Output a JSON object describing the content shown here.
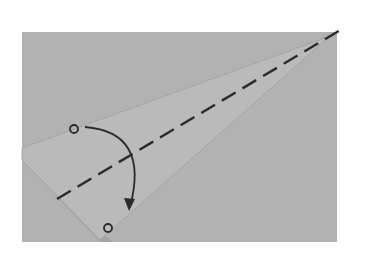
{
  "diagram": {
    "type": "origami-fold-step",
    "colors": {
      "background": "#ffffff",
      "paper": "#b2b2b2",
      "flap": "#bababa",
      "flap_edge": "#9a9a9a",
      "shadow": "#8f8f8f",
      "line": "#2a2a2a"
    },
    "paper": {
      "x": 22,
      "y": 32,
      "width": 315,
      "height": 210
    },
    "flap_polygon": "22,148 330,36 100,240 22,160",
    "fold_line": {
      "x1": 57,
      "y1": 199,
      "x2": 342,
      "y2": 29,
      "style": "valley-dashed"
    },
    "points": [
      {
        "name": "start",
        "cx": 74,
        "cy": 129,
        "r": 4
      },
      {
        "name": "end",
        "cx": 108,
        "cy": 228,
        "r": 4
      }
    ],
    "arrow": {
      "path": "M 85 127 Q 150 132 130 207"
    }
  }
}
